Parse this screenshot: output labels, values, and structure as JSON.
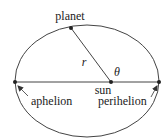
{
  "diagram": {
    "type": "elliptical-orbit",
    "colors": {
      "line": "#444444",
      "text": "#222222",
      "background": "#ffffff"
    },
    "ellipse": {
      "cx": 87,
      "cy": 81,
      "rx": 72,
      "ry": 56
    },
    "points": {
      "planet": {
        "x": 71,
        "y": 28
      },
      "sun": {
        "x": 111,
        "y": 82
      },
      "aphelion": {
        "x": 15,
        "y": 82
      },
      "perihelion": {
        "x": 159,
        "y": 82
      }
    },
    "labels": {
      "planet": "planet",
      "r": "r",
      "theta": "θ",
      "sun": "sun",
      "aphelion": "aphelion",
      "perihelion": "perihelion"
    }
  }
}
